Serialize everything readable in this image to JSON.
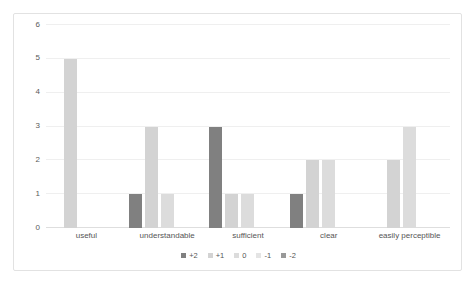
{
  "chart_data": {
    "type": "bar",
    "title": "",
    "subtitle": "",
    "xlabel": "",
    "ylabel": "",
    "ylim": [
      0,
      6
    ],
    "ytick_labels": [
      "0",
      "1",
      "2",
      "3",
      "4",
      "5",
      "6"
    ],
    "yticks": [
      0,
      1,
      2,
      3,
      4,
      5,
      6
    ],
    "grid": true,
    "legend_position": "bottom",
    "categories": [
      "useful",
      "understandable",
      "sufficient",
      "clear",
      "easily perceptible"
    ],
    "series": [
      {
        "name": "+2",
        "color": "#808080",
        "values": [
          0,
          1,
          3,
          1,
          0
        ]
      },
      {
        "name": "+1",
        "color": "#d3d3d3",
        "values": [
          5,
          3,
          1,
          2,
          2
        ]
      },
      {
        "name": "0",
        "color": "#dcdcdc",
        "values": [
          0,
          1,
          1,
          2,
          3
        ]
      },
      {
        "name": "-1",
        "color": "#e4e4e4",
        "values": [
          0,
          0,
          0,
          0,
          0
        ]
      },
      {
        "name": "-2",
        "color": "#999999",
        "values": [
          0,
          0,
          0,
          0,
          0
        ]
      }
    ]
  },
  "axis": {
    "tick_0": "0",
    "tick_1": "1",
    "tick_2": "2",
    "tick_3": "3",
    "tick_4": "4",
    "tick_5": "5",
    "tick_6": "6"
  },
  "categories": {
    "c0": "useful",
    "c1": "understandable",
    "c2": "sufficient",
    "c3": "clear",
    "c4": "easily perceptible"
  },
  "legend": {
    "i0": "+2",
    "i1": "+1",
    "i2": "0",
    "i3": "-1",
    "i4": "-2"
  },
  "colors": {
    "border": "#e2e2e2",
    "gridline": "#efefef",
    "axis": "#dedede",
    "text": "#555555",
    "series_plus2": "#808080",
    "series_plus1": "#d3d3d3",
    "series_zero": "#dcdcdc",
    "series_minus1": "#e4e4e4",
    "series_minus2": "#999999"
  }
}
